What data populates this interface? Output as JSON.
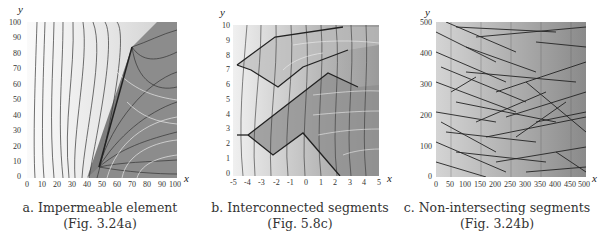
{
  "figures": [
    {
      "id": "a",
      "caption": "a. Impermeable element",
      "reference": "(Fig. 3.24a)",
      "x_label": "x",
      "y_label": "y",
      "x_ticks": [
        "0",
        "10",
        "20",
        "30",
        "40",
        "50",
        "60",
        "70",
        "80",
        "90",
        "100"
      ],
      "y_ticks": [
        "0",
        "10",
        "20",
        "30",
        "40",
        "50",
        "60",
        "70",
        "80",
        "90",
        "100"
      ]
    },
    {
      "id": "b",
      "caption": "b. Interconnected segments",
      "reference": "(Fig. 5.8c)",
      "x_label": "x",
      "y_label": "y",
      "x_ticks": [
        "-5",
        "-4",
        "-3",
        "-2",
        "-1",
        "0",
        "1",
        "2",
        "3",
        "4",
        "5"
      ],
      "y_ticks": [
        "0",
        "1",
        "2",
        "3",
        "4",
        "5",
        "6",
        "7",
        "8",
        "9",
        "10"
      ]
    },
    {
      "id": "c",
      "caption": "c. Non-intersecting segments",
      "reference": "(Fig. 3.24b)",
      "x_label": "x",
      "y_label": "y",
      "x_ticks": [
        "0",
        "50",
        "100",
        "150",
        "200",
        "250",
        "300",
        "350",
        "400",
        "450",
        "500"
      ],
      "y_ticks": [
        "0",
        "100",
        "200",
        "300",
        "400",
        "500"
      ]
    }
  ],
  "colors": {
    "light_region": "#f2f2f2",
    "dark_region": "#8a8a8a",
    "stream_lines": "#333333",
    "equipotential": "#e8e8e8"
  }
}
